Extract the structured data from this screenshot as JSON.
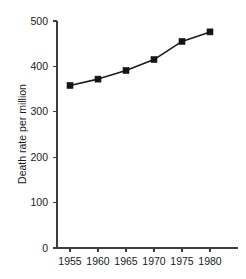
{
  "chart_data": {
    "type": "line",
    "title": "",
    "subtitle": "",
    "xlabel": "",
    "ylabel": "Death rate per million",
    "x": [
      1955,
      1960,
      1965,
      1970,
      1975,
      1980
    ],
    "categories": [
      "1955",
      "1960",
      "1965",
      "1970",
      "1975",
      "1980"
    ],
    "values": [
      358,
      372,
      391,
      415,
      455,
      476
    ],
    "series": [
      {
        "name": "Death rate per million",
        "values": [
          358,
          372,
          391,
          415,
          455,
          476
        ]
      }
    ],
    "xlim": [
      1952.5,
      1982.5
    ],
    "ylim": [
      0,
      500
    ],
    "yticks": [
      0,
      100,
      200,
      300,
      400,
      500
    ],
    "ytick_labels": [
      "0",
      "100",
      "200",
      "300",
      "400",
      "500"
    ],
    "xticks": [
      1955,
      1960,
      1965,
      1970,
      1975,
      1980
    ],
    "xtick_labels": [
      "1955",
      "1960",
      "1965",
      "1970",
      "1975",
      "1980"
    ],
    "grid": false,
    "legend": false,
    "legend_position": "none",
    "marker": "square",
    "line_color": "#1c1c1c",
    "marker_color": "#141414",
    "axis_color": "#3d3d3d",
    "background_color": "#ffffff",
    "annotations": []
  }
}
